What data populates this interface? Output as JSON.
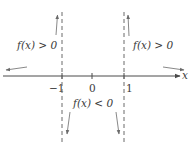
{
  "diagram": {
    "axis_label": "x",
    "ticks": [
      {
        "label": "−1",
        "x": -1
      },
      {
        "label": "0",
        "x": 0
      },
      {
        "label": "1",
        "x": 1
      }
    ],
    "asymptotes": [
      -1,
      1
    ],
    "regions": [
      {
        "label": "f(x) > 0",
        "position": "upper-left",
        "interval": "x < -1"
      },
      {
        "label": "f(x) < 0",
        "position": "lower-middle",
        "interval": "-1 < x < 1"
      },
      {
        "label": "f(x) > 0",
        "position": "upper-right",
        "interval": "x > 1"
      }
    ],
    "colors": {
      "axis": "#4a4a4a",
      "asymptote": "#6a6a6a",
      "arrow": "#7a7a7a",
      "text": "#3a3a3a"
    }
  },
  "labels": {
    "region_left": "f(x) > 0",
    "region_middle": "f(x) < 0",
    "region_right": "f(x) > 0",
    "tick_neg1": "−1",
    "tick_0": "0",
    "tick_1": "1",
    "x_axis": "x"
  }
}
